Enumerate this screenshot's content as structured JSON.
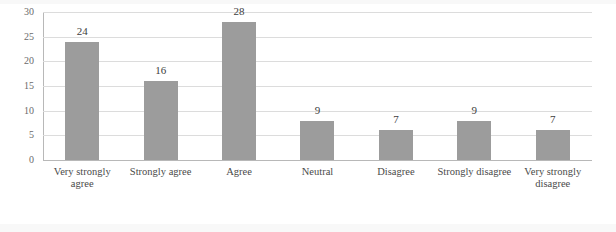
{
  "chart_data": {
    "type": "bar",
    "title": "",
    "xlabel": "",
    "ylabel": "",
    "ylim": [
      0,
      30
    ],
    "ytick_interval": 5,
    "yticks": [
      "0",
      "5",
      "10",
      "15",
      "20",
      "25",
      "30"
    ],
    "grid": true,
    "legend": "none",
    "bar_color": "#9c9c9c",
    "categories": [
      "Very strongly agree",
      "Strongly agree",
      "Agree",
      "Neutral",
      "Disagree",
      "Strongly disagree",
      "Very strongly disagree"
    ],
    "values": [
      24,
      16,
      28,
      9,
      7,
      9,
      7
    ],
    "bar_pixel_values": [
      24,
      16,
      28,
      8,
      6,
      8,
      6
    ],
    "data_labels": [
      "24",
      "16",
      "28",
      "9",
      "7",
      "9",
      "7"
    ]
  }
}
